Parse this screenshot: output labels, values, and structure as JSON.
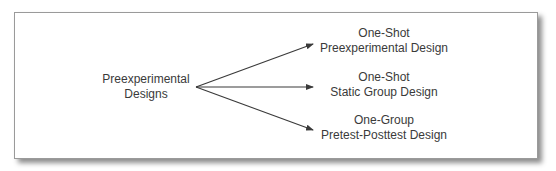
{
  "diagram": {
    "root": {
      "line1": "Preexperimental",
      "line2": "Designs"
    },
    "children": [
      {
        "line1": "One-Shot",
        "line2": "Preexperimental Design"
      },
      {
        "line1": "One-Shot",
        "line2": "Static Group Design"
      },
      {
        "line1": "One-Group",
        "line2": "Pretest-Posttest Design"
      }
    ],
    "colors": {
      "text": "#3a3a3a",
      "arrow": "#3a3a3a",
      "border": "#9a9a9a"
    }
  }
}
